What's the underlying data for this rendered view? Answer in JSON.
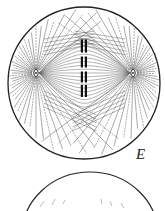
{
  "figure": {
    "panel_label": "E",
    "colors": {
      "ink": "#222222",
      "background": "#ffffff"
    },
    "cell": {
      "cx": 84,
      "cy": 83,
      "r": 76
    },
    "poles": [
      {
        "x": 36,
        "y": 73
      },
      {
        "x": 133,
        "y": 73
      }
    ],
    "chromosomes": [
      {
        "x": 84,
        "y": 46,
        "h": 13
      },
      {
        "x": 84,
        "y": 62,
        "h": 11
      },
      {
        "x": 84,
        "y": 77,
        "h": 11
      },
      {
        "x": 84,
        "y": 91,
        "h": 12
      }
    ],
    "next_panel_arc": {
      "cx": 90,
      "cy": 255,
      "rx": 68,
      "ry": 63
    }
  }
}
